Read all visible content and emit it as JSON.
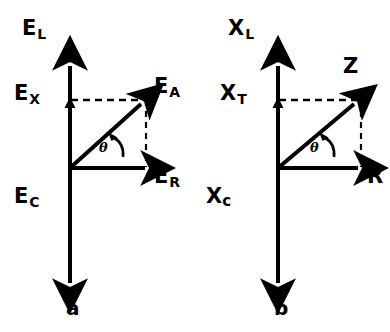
{
  "figure": {
    "background_color": "#ffffff",
    "ink_color": "#000000"
  },
  "panels": [
    {
      "tag": "a",
      "axis_up_label": {
        "base": "E",
        "sub": "L"
      },
      "axis_mid_label": {
        "base": "E",
        "sub": "X"
      },
      "axis_down_label": {
        "base": "E",
        "sub": "C"
      },
      "resultant_label": {
        "base": "E",
        "sub": "A"
      },
      "horizontal_label": {
        "base": "E",
        "sub": "R"
      },
      "angle_label": "θ"
    },
    {
      "tag": "b",
      "axis_up_label": {
        "base": "X",
        "sub": "L"
      },
      "axis_mid_label": {
        "base": "X",
        "sub": "T"
      },
      "axis_down_label": {
        "base": "X",
        "sub": "c"
      },
      "resultant_label": {
        "base": "Z",
        "sub": ""
      },
      "horizontal_label": {
        "base": "R",
        "sub": ""
      },
      "angle_label": "θ"
    }
  ]
}
